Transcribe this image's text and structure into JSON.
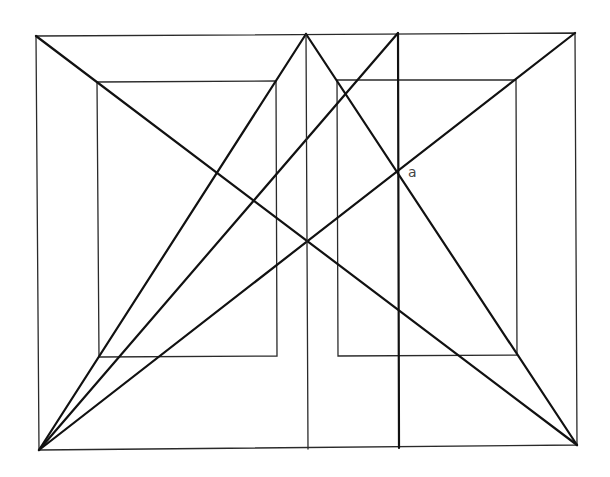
{
  "diagram": {
    "type": "geometric-construction",
    "width": 610,
    "height": 477,
    "colors": {
      "background": "#ffffff",
      "line": "#111111",
      "thin_line": "#2a2a2a",
      "label": "#444444"
    },
    "points": {
      "outer_tl": [
        36,
        36
      ],
      "outer_tr": [
        575,
        33
      ],
      "outer_bl": [
        39,
        450
      ],
      "outer_br": [
        577,
        445
      ],
      "apex": [
        306,
        34
      ],
      "thick_top": [
        398,
        33
      ],
      "thick_bottom": [
        399,
        448
      ],
      "mid_bottom": [
        308,
        449
      ],
      "a": [
        398,
        172
      ]
    },
    "labels": [
      {
        "id": "a",
        "text": "a",
        "x": 408,
        "y": 165
      }
    ],
    "rectangles": [
      {
        "name": "outer-rectangle",
        "points": [
          [
            36,
            36
          ],
          [
            575,
            33
          ],
          [
            577,
            445
          ],
          [
            39,
            450
          ]
        ],
        "style": "thin"
      },
      {
        "name": "inner-left-rectangle",
        "points": [
          [
            97,
            82
          ],
          [
            276,
            81
          ],
          [
            277,
            356
          ],
          [
            99,
            357
          ]
        ],
        "style": "thin"
      },
      {
        "name": "inner-right-rectangle",
        "points": [
          [
            337,
            80
          ],
          [
            516,
            80
          ],
          [
            517,
            355
          ],
          [
            338,
            356
          ]
        ],
        "style": "thin"
      }
    ],
    "lines": [
      {
        "name": "diagonal-tl-br",
        "from": [
          36,
          36
        ],
        "to": [
          577,
          445
        ],
        "style": "thick"
      },
      {
        "name": "diagonal-bl-tr",
        "from": [
          39,
          450
        ],
        "to": [
          575,
          33
        ],
        "style": "thick"
      },
      {
        "name": "apex-to-bl",
        "from": [
          306,
          34
        ],
        "to": [
          39,
          450
        ],
        "style": "thick"
      },
      {
        "name": "apex-to-br",
        "from": [
          306,
          34
        ],
        "to": [
          577,
          445
        ],
        "style": "thick"
      },
      {
        "name": "bl-to-thick-top",
        "from": [
          39,
          450
        ],
        "to": [
          398,
          33
        ],
        "style": "thick"
      },
      {
        "name": "center-vertical",
        "from": [
          306,
          34
        ],
        "to": [
          308,
          449
        ],
        "style": "thin"
      },
      {
        "name": "thick-vertical",
        "from": [
          398,
          33
        ],
        "to": [
          399,
          448
        ],
        "style": "thick"
      }
    ]
  }
}
